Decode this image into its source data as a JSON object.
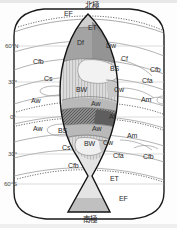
{
  "figure": {
    "type": "koppen-idealized-continent",
    "poles": {
      "north": "北極",
      "south": "南極"
    },
    "latitude_ticks": [
      {
        "id": "lat-60n",
        "label": "60°N",
        "y_pct": 20.2
      },
      {
        "id": "lat-30n",
        "label": "30°",
        "y_pct": 36.0
      },
      {
        "id": "lat-0",
        "label": "0°",
        "y_pct": 51.3
      },
      {
        "id": "lat-30s",
        "label": "30°",
        "y_pct": 67.5
      },
      {
        "id": "lat-60s",
        "label": "60°S",
        "y_pct": 80.7
      }
    ],
    "climate_labels": [
      {
        "id": "ef-top",
        "code": "EF",
        "x": 64,
        "y": 13
      },
      {
        "id": "et-top",
        "code": "ET",
        "x": 88,
        "y": 27
      },
      {
        "id": "df",
        "code": "Df",
        "x": 77,
        "y": 42
      },
      {
        "id": "dw",
        "code": "Dw",
        "x": 108,
        "y": 45
      },
      {
        "id": "cf-inner",
        "code": "Cf",
        "x": 123,
        "y": 58
      },
      {
        "id": "cfb-nw",
        "code": "Cfb",
        "x": 36,
        "y": 61
      },
      {
        "id": "cfb-ne",
        "code": "Cfb",
        "x": 153,
        "y": 69
      },
      {
        "id": "bs-north",
        "code": "BS",
        "x": 113,
        "y": 68
      },
      {
        "id": "cs-nw",
        "code": "Cs",
        "x": 46,
        "y": 78
      },
      {
        "id": "cfa-ne",
        "code": "Cfa",
        "x": 145,
        "y": 80
      },
      {
        "id": "bw-north",
        "code": "BW",
        "x": 80,
        "y": 89
      },
      {
        "id": "cw-north",
        "code": "Cw",
        "x": 117,
        "y": 89
      },
      {
        "id": "aw-nw",
        "code": "Aw",
        "x": 33,
        "y": 100
      },
      {
        "id": "am-ne",
        "code": "Am",
        "x": 144,
        "y": 99
      },
      {
        "id": "aw-north",
        "code": "Aw",
        "x": 94,
        "y": 103
      },
      {
        "id": "af",
        "code": "Af",
        "x": 112,
        "y": 116
      },
      {
        "id": "aw-sw",
        "code": "Aw",
        "x": 35,
        "y": 128
      },
      {
        "id": "bs-south",
        "code": "BS",
        "x": 61,
        "y": 130
      },
      {
        "id": "aw-south",
        "code": "Aw",
        "x": 95,
        "y": 128
      },
      {
        "id": "am-se",
        "code": "Am",
        "x": 130,
        "y": 135
      },
      {
        "id": "bw-south",
        "code": "BW",
        "x": 87,
        "y": 143
      },
      {
        "id": "cw-south",
        "code": "Cw",
        "x": 105,
        "y": 142
      },
      {
        "id": "cs-sw",
        "code": "Cs",
        "x": 64,
        "y": 147
      },
      {
        "id": "cfa-se",
        "code": "Cfa",
        "x": 116,
        "y": 155
      },
      {
        "id": "cfb-se",
        "code": "Cfb",
        "x": 146,
        "y": 156
      },
      {
        "id": "cfb-sw",
        "code": "Cfb",
        "x": 71,
        "y": 165
      },
      {
        "id": "et-bottom",
        "code": "ET",
        "x": 113,
        "y": 178
      },
      {
        "id": "ef-bottom",
        "code": "EF",
        "x": 122,
        "y": 198
      }
    ],
    "colors": {
      "outline": "#1a1a1a",
      "zone_line": "#8a8a8a",
      "dotted_line": "#555555",
      "fill_ice": "#c9c9c9",
      "fill_d": "#9f9f9f",
      "fill_bw": "#ebebeb",
      "fill_bs": "#d8d8d8",
      "fill_af": "#6e6e6e",
      "fill_aw": "#b6b6b6",
      "background": "#fdfdfd",
      "text": "#2a2a2a"
    }
  }
}
